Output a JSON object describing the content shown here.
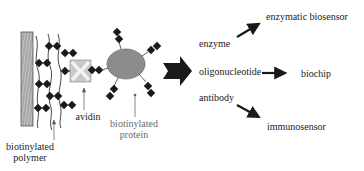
{
  "diagram": {
    "type": "schematic",
    "title": "",
    "left_panel": {
      "labels": {
        "polymer_line1": "biotinylated",
        "polymer_line2": "polymer",
        "avidin": "avidin",
        "protein_line1": "biotinylated",
        "protein_line2": "protein"
      }
    },
    "right_panel": {
      "items": [
        {
          "source": "enzyme",
          "target": "enzymatic biosensor"
        },
        {
          "source": "oligonucleotide",
          "target": "biochip"
        },
        {
          "source": "antibody",
          "target": "immunosensor"
        }
      ]
    },
    "colors": {
      "text": "#222222",
      "text_grey": "#6a6a6a",
      "biotin_marker": "#1a1a1a",
      "avidin_fill": "#c8c8c8",
      "protein_fill": "#8c8c8c",
      "substrate_fill": "#b0b0b0",
      "arrow": "#1a1a1a"
    }
  }
}
